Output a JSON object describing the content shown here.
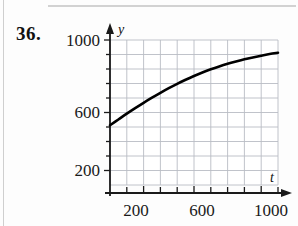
{
  "exercise": {
    "number_label": "36."
  },
  "chart_data": {
    "type": "line",
    "title": "",
    "subtitle": "",
    "xlabel": "t",
    "ylabel": "y",
    "grid": true,
    "legend": "none",
    "xlim": [
      0,
      1000
    ],
    "ylim": [
      0,
      1000
    ],
    "x_major_ticks": [
      200,
      600,
      1000
    ],
    "x_major_tick_labels": [
      "200",
      "600",
      "1000"
    ],
    "x_minor_tick_step": 100,
    "y_major_ticks": [
      200,
      600,
      1000
    ],
    "y_major_tick_labels": [
      "200",
      "600",
      "1000"
    ],
    "y_minor_tick_step": 100,
    "grid_x_step": 100,
    "grid_y_step": 100,
    "curve_color": "#000000",
    "grid_color": "#b9bcc4",
    "axis_color": "#1a1a1a",
    "series": [
      {
        "name": "y(t)",
        "x": [
          0,
          50,
          100,
          150,
          200,
          250,
          300,
          350,
          400,
          450,
          500,
          550,
          600,
          650,
          700,
          750,
          800,
          850,
          900,
          950,
          1000
        ],
        "y": [
          412,
          452,
          492,
          530,
          567,
          602,
          636,
          668,
          698,
          726,
          752,
          776,
          798,
          818,
          836,
          852,
          867,
          880,
          892,
          903,
          912
        ]
      }
    ],
    "annotations": []
  },
  "axis_labels": {
    "y_axis_variable": "y",
    "x_axis_variable": "t",
    "y_1000": "1000",
    "y_600": "600",
    "y_200": "200",
    "x_200": "200",
    "x_600": "600",
    "x_1000": "1000"
  }
}
